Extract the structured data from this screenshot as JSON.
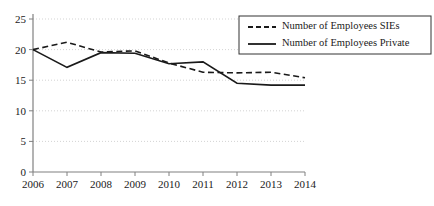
{
  "chart_data": {
    "type": "line",
    "title": "",
    "xlabel": "",
    "ylabel": "",
    "x": [
      "2006",
      "2007",
      "2008",
      "2009",
      "2010",
      "2011",
      "2012",
      "2013",
      "2014"
    ],
    "categories": [
      "2006",
      "2007",
      "2008",
      "2009",
      "2010",
      "2011",
      "2012",
      "2013",
      "2014"
    ],
    "series": [
      {
        "name": "Number of Employees SIEs",
        "style": "dashed",
        "color": "#1a1a1a",
        "values": [
          20.0,
          21.2,
          19.6,
          19.8,
          17.8,
          16.3,
          16.2,
          16.3,
          15.4
        ]
      },
      {
        "name": "Number of Employees Private",
        "style": "solid",
        "color": "#1a1a1a",
        "values": [
          20.0,
          17.1,
          19.5,
          19.4,
          17.7,
          18.0,
          14.5,
          14.2,
          14.2
        ]
      }
    ],
    "ylim": [
      0,
      25
    ],
    "yticks": [
      0,
      5,
      10,
      15,
      20,
      25
    ],
    "ytick_labels": [
      "0",
      "5",
      "10",
      "15",
      "20",
      "25"
    ],
    "xtick_labels": [
      "2006",
      "2007",
      "2008",
      "2009",
      "2010",
      "2011",
      "2012",
      "2013",
      "2014"
    ],
    "grid": true,
    "grid_axis": "y",
    "grid_style": "dotted",
    "grid_color": "#c8c8c8",
    "legend": {
      "position": "top-right",
      "bordered": true,
      "entries": [
        {
          "label": "Number of Employees SIEs",
          "style": "dashed"
        },
        {
          "label": "Number of Employees Private",
          "style": "solid"
        }
      ]
    },
    "axis_color": "#808080",
    "background": "#ffffff"
  }
}
